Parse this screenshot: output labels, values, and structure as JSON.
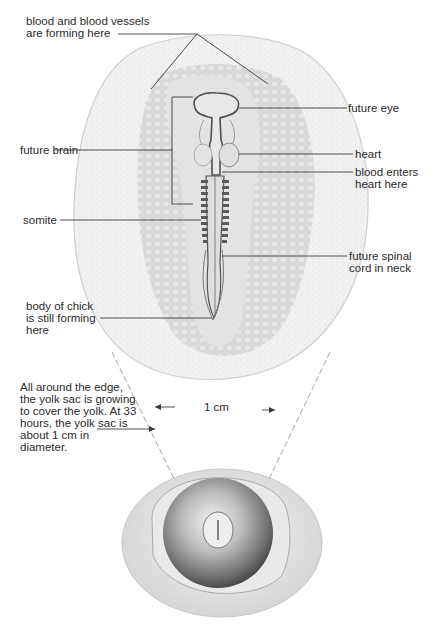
{
  "labels": {
    "blood_vessels": [
      "blood and blood vessels",
      "are forming here"
    ],
    "future_eye": "future eye",
    "future_brain": "future brain",
    "heart": "heart",
    "blood_enters": [
      "blood enters",
      "heart here"
    ],
    "somite": "somite",
    "spinal_cord": [
      "future spinal",
      "cord in neck"
    ],
    "body_forming": [
      "body of chick",
      "is still forming",
      "here"
    ],
    "yolk_sac_note": [
      "All around the edge,",
      "the yolk sac is growing",
      "to cover the yolk. At 33",
      "hours, the yolk sac is",
      "about 1 cm in",
      "diameter."
    ],
    "scale": "1 cm"
  },
  "colors": {
    "line": "#3a3a3a",
    "yolk_sac": "#ececec",
    "area_pellucida": "#d9d9d9",
    "embryo": "#5a5a5a",
    "egg_shell": "#e2e2e2",
    "yolk": "#8c8c8c"
  }
}
